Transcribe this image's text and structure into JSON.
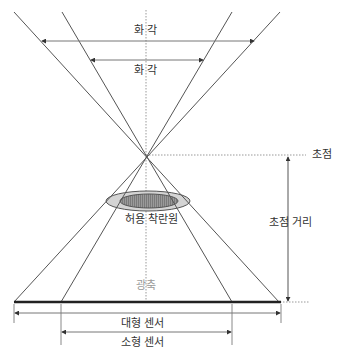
{
  "diagram": {
    "labels": {
      "angle_of_view_wide": "화 각",
      "angle_of_view_narrow": "화 각",
      "focal_point": "초점",
      "circle_of_confusion": "허용 착란원",
      "focal_length": "초점 거리",
      "optical_axis": "광축",
      "large_sensor": "대형 센서",
      "small_sensor": "소형 센서"
    },
    "colors": {
      "line": "#555555",
      "dotted": "#999999",
      "sensor": "#222222",
      "ellipse_outer": "#d0d0d0",
      "ellipse_inner": "#8c8c8c"
    }
  }
}
